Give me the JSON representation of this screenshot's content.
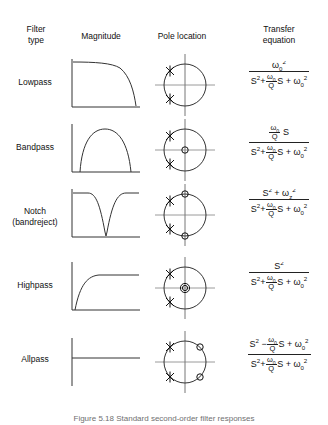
{
  "figure": {
    "caption": "Figure 5.18  Standard second-order filter responses",
    "columns": [
      {
        "id": "filter-type",
        "label_line1": "Filter",
        "label_line2": "type"
      },
      {
        "id": "magnitude",
        "label_line1": "Magnitude",
        "label_line2": ""
      },
      {
        "id": "pole-location",
        "label_line1": "Pole location",
        "label_line2": ""
      },
      {
        "id": "transfer-equation",
        "label_line1": "Transfer",
        "label_line2": "equation"
      }
    ],
    "symbols": {
      "omega": "ω",
      "zero_sub": "0",
      "z_sub": "z",
      "pole_marker": "∗",
      "zero_marker": "○",
      "S": "S",
      "Q": "Q"
    },
    "rows": [
      {
        "id": "lowpass",
        "label_line1": "Lowpass",
        "label_line2": "",
        "magnitude": {
          "shape": "lowpass",
          "description": "flat passband that rolls off at high frequency"
        },
        "poles": {
          "pole_angles_deg": [
            135,
            225
          ],
          "zeros": [],
          "zero_at_origin_count": 0,
          "zeros_on_imaginary_axis": false
        },
        "equation": {
          "numerator": "ω0²",
          "denominator": "S² + (ω0/Q) S + ω0²"
        }
      },
      {
        "id": "bandpass",
        "label_line1": "Bandpass",
        "label_line2": "",
        "magnitude": {
          "shape": "bandpass",
          "description": "bell shaped peak at center frequency"
        },
        "poles": {
          "pole_angles_deg": [
            135,
            225
          ],
          "zeros": [],
          "zero_at_origin_count": 1,
          "zeros_on_imaginary_axis": false
        },
        "equation": {
          "numerator": "(ω0/Q) S",
          "denominator": "S² + (ω0/Q) S + ω0²"
        }
      },
      {
        "id": "notch",
        "label_line1": "Notch",
        "label_line2": "(bandreject)",
        "magnitude": {
          "shape": "notch",
          "description": "flat with a deep narrow null at center frequency"
        },
        "poles": {
          "pole_angles_deg": [
            135,
            225
          ],
          "zeros": [],
          "zero_at_origin_count": 0,
          "zeros_on_imaginary_axis": true
        },
        "equation": {
          "numerator": "S² + ωz²",
          "denominator": "S² + (ω0/Q) S + ω0²"
        }
      },
      {
        "id": "highpass",
        "label_line1": "Highpass",
        "label_line2": "",
        "magnitude": {
          "shape": "highpass",
          "description": "rises from zero then flattens at high frequency"
        },
        "poles": {
          "pole_angles_deg": [
            135,
            225
          ],
          "zeros": [],
          "zero_at_origin_count": 2,
          "zeros_on_imaginary_axis": false
        },
        "equation": {
          "numerator": "S²",
          "denominator": "S² + (ω0/Q) S + ω0²"
        }
      },
      {
        "id": "allpass",
        "label_line1": "Allpass",
        "label_line2": "",
        "magnitude": {
          "shape": "allpass",
          "description": "flat magnitude at all frequencies"
        },
        "poles": {
          "pole_angles_deg": [
            135,
            225
          ],
          "zero_angles_deg": [
            45,
            315
          ],
          "zero_at_origin_count": 0,
          "zeros_on_imaginary_axis": false
        },
        "equation": {
          "numerator": "S² − (ω0/Q) S + ω0²",
          "denominator": "S² + (ω0/Q) S + ω0²"
        }
      }
    ]
  }
}
